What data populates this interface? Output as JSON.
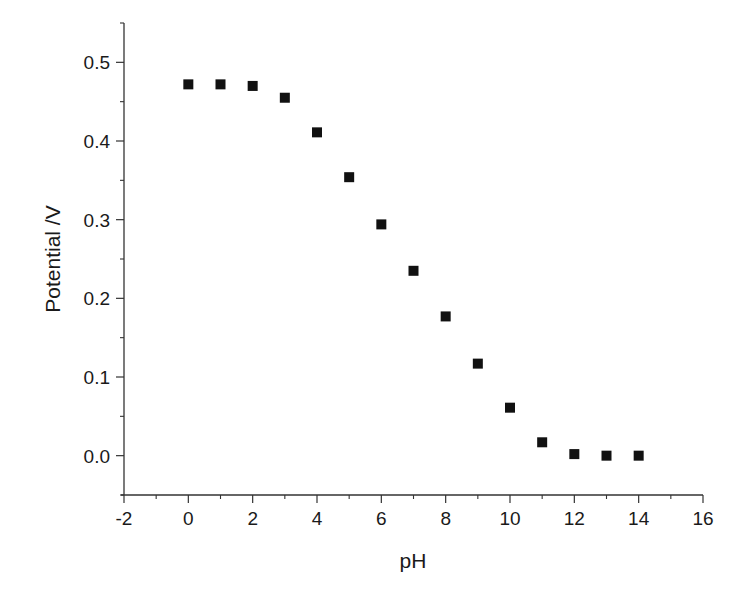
{
  "chart_data": {
    "type": "scatter",
    "title": "",
    "xlabel": "pH",
    "ylabel": "Potential /V",
    "xlim": [
      -2,
      16
    ],
    "ylim": [
      -0.05,
      0.55
    ],
    "x_ticks": [
      -2,
      0,
      2,
      4,
      6,
      8,
      10,
      12,
      14,
      16
    ],
    "x_tick_labels": [
      "-2",
      "0",
      "2",
      "4",
      "6",
      "8",
      "10",
      "12",
      "14",
      "16"
    ],
    "y_ticks": [
      0.0,
      0.1,
      0.2,
      0.3,
      0.4,
      0.5
    ],
    "y_tick_labels": [
      "0.0",
      "0.1",
      "0.2",
      "0.3",
      "0.4",
      "0.5"
    ],
    "grid": false,
    "legend": null,
    "series": [
      {
        "name": "Potential",
        "marker": "square",
        "color": "#111111",
        "x": [
          0,
          1,
          2,
          3,
          4,
          5,
          6,
          7,
          8,
          9,
          10,
          11,
          12,
          13,
          14
        ],
        "y": [
          0.472,
          0.472,
          0.47,
          0.455,
          0.411,
          0.354,
          0.294,
          0.235,
          0.177,
          0.117,
          0.061,
          0.017,
          0.002,
          0.0,
          0.0
        ]
      }
    ]
  },
  "labels": {
    "xlabel": "pH",
    "ylabel": "Potential /V"
  }
}
